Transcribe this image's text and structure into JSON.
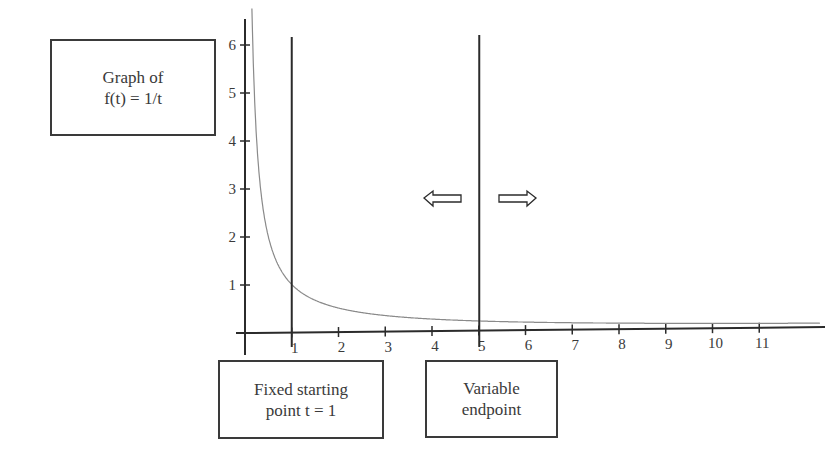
{
  "chart_data": {
    "type": "line",
    "title": "Graph of f(t) = 1/t",
    "function": "f(t) = 1/t",
    "xlabel": "",
    "ylabel": "",
    "x_ticks": [
      "1",
      "2",
      "3",
      "4",
      "5",
      "6",
      "7",
      "8",
      "9",
      "10",
      "11"
    ],
    "y_ticks": [
      "1",
      "2",
      "3",
      "4",
      "5",
      "6"
    ],
    "xlim": [
      0,
      11.8
    ],
    "ylim": [
      0,
      6.4
    ],
    "grid": false,
    "series": [
      {
        "name": "f(t) = 1/t",
        "x": [
          0.15,
          0.2,
          0.3,
          0.4,
          0.5,
          0.75,
          1,
          1.5,
          2,
          3,
          4,
          5,
          6,
          7,
          8,
          9,
          10,
          11,
          11.8
        ],
        "values": [
          6.67,
          5,
          3.33,
          2.5,
          2,
          1.33,
          1,
          0.67,
          0.5,
          0.33,
          0.25,
          0.2,
          0.17,
          0.14,
          0.125,
          0.11,
          0.1,
          0.09,
          0.085
        ]
      }
    ],
    "vertical_lines": [
      {
        "x": 1,
        "label": "Fixed starting point t = 1"
      },
      {
        "x": 5,
        "label": "Variable endpoint"
      }
    ],
    "annotations": [
      {
        "type": "arrow-left",
        "near_x": 4.1,
        "y": 2.8
      },
      {
        "type": "arrow-right",
        "near_x": 5.9,
        "y": 2.8
      }
    ]
  },
  "labels": {
    "graph_box": [
      "Graph of",
      "f(t) = 1/t"
    ],
    "fixed_box": [
      "Fixed starting",
      "point t = 1"
    ],
    "variable_box": [
      "Variable",
      "endpoint"
    ]
  },
  "colors": {
    "axis": "#2b2b2b",
    "curve": "#8a8a8a",
    "text": "#3a3a3a"
  }
}
